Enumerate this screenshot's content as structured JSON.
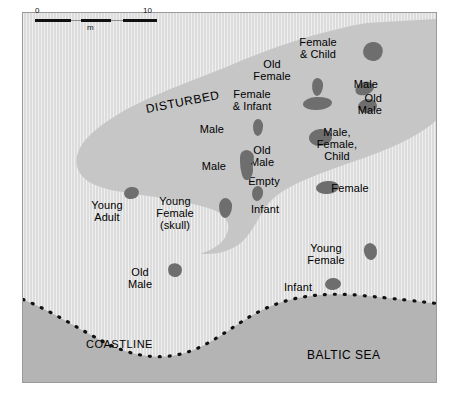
{
  "figure": {
    "type": "archaeological-site-map",
    "scalebar": {
      "left_label": "0",
      "right_label": "10",
      "unit": "m"
    },
    "area_labels": {
      "disturbed": "Disturbed",
      "coastline": "Coastline",
      "sea": "Baltic Sea"
    },
    "colors": {
      "land": "#dcdcdc",
      "disturbed": "#c6c6c6",
      "sea": "#b4b4b4",
      "grave": "#6e6e6e",
      "text": "#000000",
      "frame": "#9a9a9a"
    },
    "graves": [
      {
        "label": "Female\n& Child",
        "label_x": 318,
        "label_y": 36,
        "align": "ctr",
        "gx": 363,
        "gy": 42,
        "gw": 20,
        "gh": 19,
        "rot": -12,
        "br": "48% 52% 46% 54% / 52% 44% 56% 48%"
      },
      {
        "label": "Old\nFemale",
        "label_x": 272,
        "label_y": 58,
        "align": "ctr",
        "gx": 312,
        "gy": 78,
        "gw": 11,
        "gh": 18,
        "rot": 4,
        "br": "46% 54% 50% 50% / 40% 40% 60% 60%"
      },
      {
        "label": "Male",
        "label_x": 378,
        "label_y": 78,
        "align": "rt",
        "gx": 355,
        "gy": 82,
        "gw": 19,
        "gh": 13,
        "rot": -16,
        "br": "54% 46% 50% 50% / 56% 50% 50% 44%"
      },
      {
        "label": "Old\nMale",
        "label_x": 382,
        "label_y": 92,
        "align": "rt",
        "gx": 358,
        "gy": 99,
        "gw": 19,
        "gh": 14,
        "rot": -10,
        "br": "50% 50% 46% 54% / 50% 54% 46% 50%"
      },
      {
        "label": "Female\n& Infant",
        "label_x": 252,
        "label_y": 88,
        "align": "ctr",
        "gx": 303,
        "gy": 97,
        "gw": 29,
        "gh": 13,
        "rot": -3,
        "br": "46% 54% 50% 50% / 52% 48% 52% 48%"
      },
      {
        "label": "Male",
        "label_x": 224,
        "label_y": 123,
        "align": "rt",
        "gx": 253,
        "gy": 119,
        "gw": 10,
        "gh": 17,
        "rot": 2,
        "br": "48% 52% 50% 50% / 42% 42% 58% 58%"
      },
      {
        "label": "Male,\nFemale,\nChild",
        "label_x": 337,
        "label_y": 126,
        "align": "ctr",
        "gx": 309,
        "gy": 129,
        "gw": 23,
        "gh": 17,
        "rot": -5,
        "br": "50% 50% 50% 50% / 50% 50% 50% 50%"
      },
      {
        "label": "Old\nMale",
        "label_x": 262,
        "label_y": 144,
        "align": "ctr",
        "gx": 240,
        "gy": 152,
        "gw": 13,
        "gh": 28,
        "rot": 0,
        "br": "44% 56% 52% 48% / 30% 30% 70% 70%"
      },
      {
        "label": "Male",
        "label_x": 226,
        "label_y": 160,
        "align": "rt",
        "gx": 0,
        "gy": 0,
        "gw": 0,
        "gh": 0,
        "rot": 0,
        "br": "50%"
      },
      {
        "label": "Empty",
        "label_x": 264,
        "label_y": 175,
        "align": "ctr",
        "gx": 0,
        "gy": 0,
        "gw": 0,
        "gh": 0,
        "rot": 0,
        "br": "50%"
      },
      {
        "label": "Female",
        "label_x": 350,
        "label_y": 182,
        "align": "ctr",
        "gx": 316,
        "gy": 181,
        "gw": 23,
        "gh": 13,
        "rot": -4,
        "br": "50% 50% 50% 50% / 50% 50% 50% 50%"
      },
      {
        "label": "Infant",
        "label_x": 265,
        "label_y": 203,
        "align": "ctr",
        "gx": 252,
        "gy": 186,
        "gw": 11,
        "gh": 15,
        "rot": 8,
        "br": "48% 52% 50% 50% / 46% 46% 54% 54%"
      },
      {
        "label": "Young\nAdult",
        "label_x": 107,
        "label_y": 199,
        "align": "ctr",
        "gx": 124,
        "gy": 187,
        "gw": 15,
        "gh": 12,
        "rot": -10,
        "br": "50% 50% 48% 52% / 52% 48% 52% 48%"
      },
      {
        "label": "Young\nFemale\n(skull)",
        "label_x": 175,
        "label_y": 195,
        "align": "ctr",
        "gx": 219,
        "gy": 198,
        "gw": 13,
        "gh": 20,
        "rot": 3,
        "br": "46% 54% 50% 50% / 42% 42% 58% 58%"
      },
      {
        "label": "Old\nMale",
        "label_x": 140,
        "label_y": 266,
        "align": "ctr",
        "gx": 168,
        "gy": 263,
        "gw": 14,
        "gh": 14,
        "rot": -20,
        "br": "40% 60% 46% 54% / 56% 48% 52% 44%"
      },
      {
        "label": "Young\nFemale",
        "label_x": 326,
        "label_y": 242,
        "align": "ctr",
        "gx": 364,
        "gy": 243,
        "gw": 13,
        "gh": 17,
        "rot": -8,
        "br": "46% 54% 50% 50% / 46% 46% 54% 54%"
      },
      {
        "label": "Infant",
        "label_x": 298,
        "label_y": 281,
        "align": "ctr",
        "gx": 325,
        "gy": 278,
        "gw": 16,
        "gh": 12,
        "rot": -4,
        "br": "48% 52% 50% 50% / 50% 50% 50% 50%"
      }
    ]
  }
}
